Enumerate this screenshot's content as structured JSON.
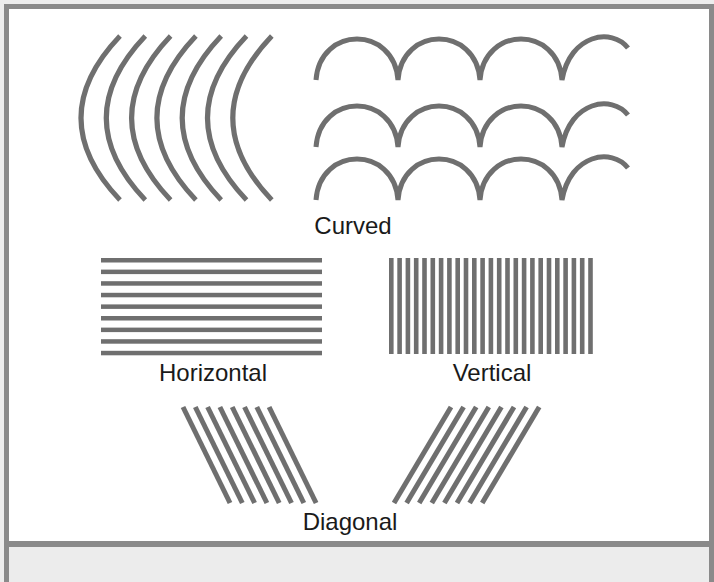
{
  "figure": {
    "labels": {
      "curved": "Curved",
      "horizontal": "Horizontal",
      "vertical": "Vertical",
      "diagonal": "Diagonal"
    },
    "colors": {
      "line": "#6f6f6f",
      "border": "#8a8a8a",
      "background": "#ffffff",
      "footer": "#ececec",
      "text": "#1a1a1a"
    },
    "groups": {
      "curved_arcs": {
        "count": 7,
        "description": "concentric left-bowed arcs"
      },
      "curved_arches": {
        "rows": 3,
        "arches_per_row": 3.5,
        "description": "scalloped arch rows"
      },
      "horizontal_lines": {
        "count": 9
      },
      "vertical_lines": {
        "count": 25
      },
      "diagonal_left": {
        "count": 8,
        "direction": "down-right"
      },
      "diagonal_right": {
        "count": 8,
        "direction": "down-left"
      }
    }
  }
}
